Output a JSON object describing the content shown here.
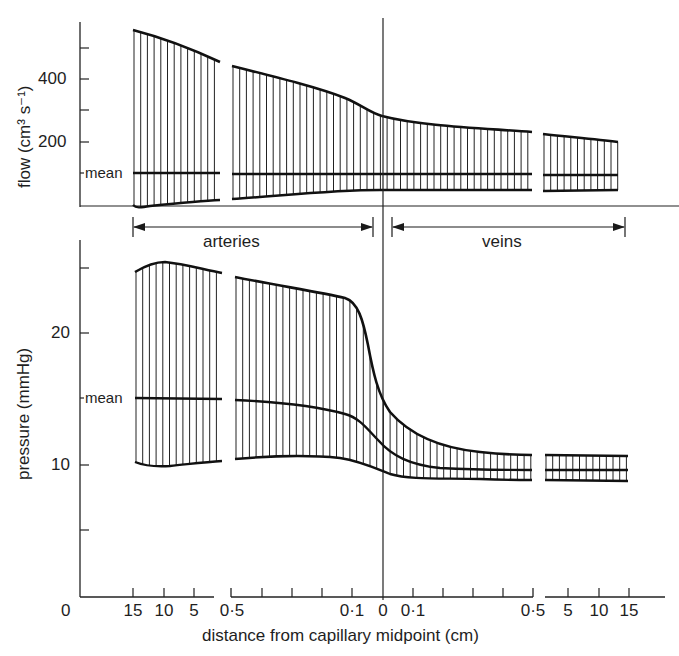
{
  "chart_data": [
    {
      "type": "area",
      "panel": "top",
      "title": "",
      "ylabel": "flow (cm³ s⁻¹)",
      "xlabel": "distance from capillary midpoint (cm)",
      "ylim": [
        0,
        550
      ],
      "yticks": [
        100,
        200,
        300,
        400,
        500
      ],
      "ytick_labels": [
        "200",
        "400"
      ],
      "annotations": [
        "mean"
      ],
      "mean_value": 100,
      "x_categories": [
        "15",
        "10",
        "5",
        "0·5",
        "0·1",
        "0",
        "0·1",
        "0·5",
        "5",
        "10",
        "15"
      ],
      "series": [
        {
          "name": "maximum (pulsatile peak)",
          "x": [
            "15 (art)",
            "5 (art)",
            "0·5 (art)",
            "0·1 (art)",
            "0",
            "0·1 (vein)",
            "0·5 (vein)",
            "5 (vein)",
            "15 (vein)"
          ],
          "values": [
            560,
            455,
            440,
            340,
            300,
            290,
            240,
            225,
            200
          ]
        },
        {
          "name": "mean",
          "values": [
            100,
            100,
            100,
            100,
            100,
            100,
            100,
            100,
            100
          ]
        },
        {
          "name": "minimum",
          "values": [
            -5,
            15,
            20,
            45,
            48,
            50,
            50,
            50,
            50
          ]
        }
      ]
    },
    {
      "type": "area",
      "panel": "bottom",
      "title": "",
      "ylabel": "pressure (mmHg)",
      "xlabel": "distance from capillary midpoint (cm)",
      "ylim": [
        0,
        27
      ],
      "yticks": [
        5,
        10,
        15,
        20,
        25
      ],
      "ytick_labels": [
        "10",
        "20"
      ],
      "annotations": [
        "mean"
      ],
      "x_categories": [
        "15",
        "10",
        "5",
        "0·5",
        "0·1",
        "0",
        "0·1",
        "0·5",
        "5",
        "10",
        "15"
      ],
      "series": [
        {
          "name": "systolic (upper)",
          "x": [
            "15 (art)",
            "10 (art)",
            "5 (art)",
            "0·5 (art)",
            "0·1 (art)",
            "0",
            "0·1 (vein)",
            "0·5 (vein)",
            "5 (vein)",
            "15 (vein)"
          ],
          "values": [
            24.6,
            25.3,
            24.4,
            24.2,
            22.5,
            14,
            11,
            9.0,
            8.9,
            8.8
          ]
        },
        {
          "name": "mean",
          "values": [
            15.0,
            15.0,
            14.9,
            14.8,
            13.8,
            11,
            9.2,
            8.0,
            8.0,
            7.9
          ]
        },
        {
          "name": "diastolic (lower)",
          "values": [
            10.2,
            10.0,
            10.4,
            10.5,
            10.3,
            8.5,
            7.5,
            7.2,
            7.1,
            7.0
          ]
        }
      ]
    }
  ],
  "axes": {
    "flow": {
      "title": "flow (cm³ s⁻¹)",
      "ticks": [
        {
          "label": "400",
          "y": 79
        },
        {
          "label": "200",
          "y": 142
        }
      ],
      "mean_label": "mean"
    },
    "pressure": {
      "title": "pressure (mmHg)",
      "ticks": [
        {
          "label": "20",
          "y": 333
        },
        {
          "label": "10",
          "y": 465
        }
      ],
      "mean_label": "mean"
    },
    "x": {
      "title": "distance from capillary midpoint (cm)",
      "origin_label": "0",
      "tick_labels": [
        {
          "label": "15",
          "x": 133
        },
        {
          "label": "10",
          "x": 164
        },
        {
          "label": "5",
          "x": 194
        },
        {
          "label": "0·5",
          "x": 232
        },
        {
          "label": "0·1",
          "x": 352
        },
        {
          "label": "0",
          "x": 383
        },
        {
          "label": "0·1",
          "x": 413
        },
        {
          "label": "0·5",
          "x": 533
        },
        {
          "label": "5",
          "x": 568
        },
        {
          "label": "10",
          "x": 599
        },
        {
          "label": "15",
          "x": 629
        }
      ]
    }
  },
  "regions": {
    "arteries": "arteries",
    "veins": "veins"
  }
}
